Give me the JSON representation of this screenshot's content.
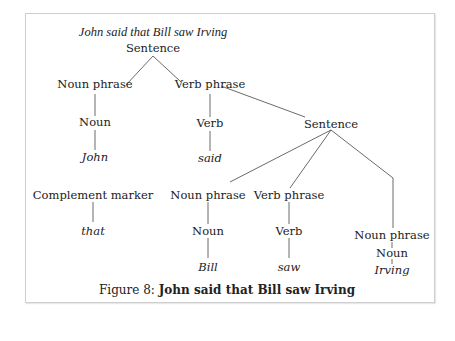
{
  "diagram": {
    "title": "John said that Bill saw Irving",
    "nodes": {
      "s1": "Sentence",
      "np1": "Noun phrase",
      "n1": "Noun",
      "w_john": "John",
      "vp1": "Verb phrase",
      "v1": "Verb",
      "w_said": "said",
      "s2": "Sentence",
      "cm": "Complement marker",
      "w_that": "that",
      "np2": "Noun phrase",
      "n2": "Noun",
      "w_bill": "Bill",
      "vp2": "Verb phrase",
      "v2": "Verb",
      "w_saw": "saw",
      "np3": "Noun phrase",
      "n3": "Noun",
      "w_irving": "Irving"
    }
  },
  "caption": {
    "prefix": "Figure 8: ",
    "text": "John said that Bill saw Irving"
  }
}
